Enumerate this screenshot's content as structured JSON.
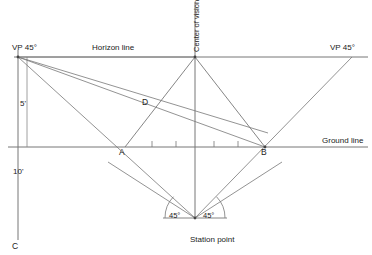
{
  "diagram": {
    "stroke_color": "#555555",
    "text_color": "#222222",
    "background": "#ffffff"
  },
  "labels": {
    "vp_left": "VP 45°",
    "vp_right": "VP 45°",
    "horizon_line": "Horizon line",
    "ground_line": "Ground line",
    "center_of_vision": "Center of vision",
    "station_point": "Station point",
    "height_upper": "5'",
    "height_lower": "10'",
    "point_a": "A",
    "point_b": "B",
    "point_c": "C",
    "point_d": "D",
    "angle_left": "45°",
    "angle_right": "45°"
  },
  "geometry": {
    "horizon_y": 57,
    "ground_y": 147,
    "center_x": 195,
    "vp_left_x": 18,
    "vp_right_x": 352,
    "station_point": {
      "x": 195,
      "y": 218
    },
    "point_a": {
      "x": 125,
      "y": 147
    },
    "point_b": {
      "x": 265,
      "y": 147
    },
    "point_c": {
      "x": 18,
      "y": 240
    },
    "point_d": {
      "x": 147,
      "y": 104
    },
    "apex": {
      "x": 195,
      "y": 57
    },
    "measure_line_x": 18,
    "measure_offset_x": 30,
    "tick_marks_x": [
      152,
      176,
      214,
      238
    ],
    "tick_top_y": 141,
    "tick_bottom_y": 147
  }
}
